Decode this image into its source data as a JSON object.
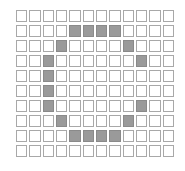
{
  "puzzle": {
    "type": "pixel-grid",
    "rows": 10,
    "cols": 12,
    "colors": {
      "filled": "#9a9a9a",
      "filled_border": "#8a8a8a",
      "empty": "#ffffff",
      "empty_border": "#a8a8a8"
    },
    "filled_cells": [
      [
        1,
        4
      ],
      [
        1,
        5
      ],
      [
        1,
        6
      ],
      [
        1,
        7
      ],
      [
        2,
        3
      ],
      [
        2,
        8
      ],
      [
        3,
        2
      ],
      [
        3,
        9
      ],
      [
        4,
        2
      ],
      [
        5,
        2
      ],
      [
        6,
        2
      ],
      [
        6,
        9
      ],
      [
        7,
        3
      ],
      [
        7,
        8
      ],
      [
        8,
        4
      ],
      [
        8,
        5
      ],
      [
        8,
        6
      ],
      [
        8,
        7
      ]
    ]
  }
}
